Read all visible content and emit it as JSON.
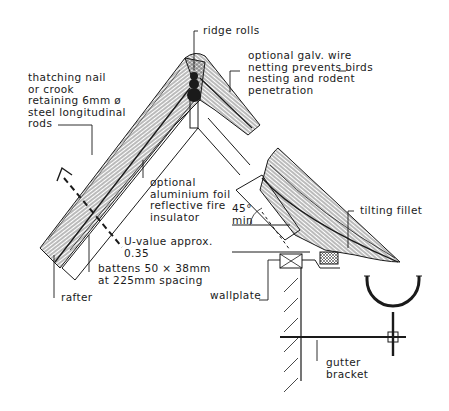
{
  "diagram": {
    "colors": {
      "ink": "#1a1a1a",
      "background": "#ffffff"
    },
    "labels": {
      "ridge_rolls": "ridge rolls",
      "wire_netting": "optional galv. wire\nnetting prevents birds\nnesting and rodent\npenetration",
      "thatching_nail": "thatching nail\nor crook\nretaining 6mm ø\nsteel longitudinal\nrods",
      "foil": "optional\naluminium foil\nreflective fire\ninsulator",
      "u_value": "U-value approx.\n0.35",
      "battens": "battens 50 × 38mm\nat 225mm spacing",
      "rafter": "rafter",
      "angle": "45°\nmin",
      "tilting_fillet": "tilting fillet",
      "wallplate": "wallplate",
      "gutter_bracket": "gutter\nbracket"
    }
  }
}
